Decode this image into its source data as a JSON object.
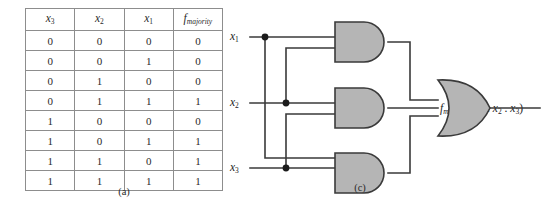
{
  "figure": {
    "parts": [
      {
        "id": "a",
        "caption": "(a)",
        "kind": "truth-table"
      },
      {
        "id": "c",
        "caption": "(c)",
        "kind": "logic-circuit"
      }
    ]
  },
  "truth_table": {
    "headers": [
      "x3",
      "x2",
      "x1",
      "fmajority"
    ],
    "header_display": [
      {
        "base": "x",
        "sub": "3",
        "sub_italic": false
      },
      {
        "base": "x",
        "sub": "2",
        "sub_italic": false
      },
      {
        "base": "x",
        "sub": "1",
        "sub_italic": false
      },
      {
        "base": "f",
        "sub": "majority",
        "sub_italic": true
      }
    ],
    "rows": [
      [
        "0",
        "0",
        "0",
        "0"
      ],
      [
        "0",
        "0",
        "1",
        "0"
      ],
      [
        "0",
        "1",
        "0",
        "0"
      ],
      [
        "0",
        "1",
        "1",
        "1"
      ],
      [
        "1",
        "0",
        "0",
        "0"
      ],
      [
        "1",
        "0",
        "1",
        "1"
      ],
      [
        "1",
        "1",
        "0",
        "1"
      ],
      [
        "1",
        "1",
        "1",
        "1"
      ]
    ]
  },
  "circuit": {
    "inputs": [
      {
        "name": "x1",
        "base": "x",
        "sub": "1"
      },
      {
        "name": "x2",
        "base": "x",
        "sub": "2"
      },
      {
        "name": "x3",
        "base": "x",
        "sub": "3"
      }
    ],
    "output": {
      "name": "fmajority",
      "base": "f",
      "sub": "majority",
      "args": " (x",
      "arg1_sub": "1",
      "sep1": " . x",
      "arg2_sub": "2",
      "sep2": " . x",
      "arg3_sub": "3",
      "close": ")"
    },
    "gates": [
      {
        "id": "and-gate-1",
        "type": "AND",
        "inputs": [
          "x1",
          "x2"
        ]
      },
      {
        "id": "and-gate-2",
        "type": "AND",
        "inputs": [
          "x2",
          "x3"
        ]
      },
      {
        "id": "and-gate-3",
        "type": "AND",
        "inputs": [
          "x1",
          "x3"
        ]
      },
      {
        "id": "or-gate-1",
        "type": "OR",
        "inputs": [
          "and-gate-1",
          "and-gate-2",
          "and-gate-3"
        ]
      }
    ],
    "junction_count": 3
  },
  "colors": {
    "gate_fill": "#b5b5b5",
    "gate_stroke": "#3a3a3a",
    "wire": "#3a3a3a",
    "table_border": "#8d8d8d",
    "text": "#1b1b1b",
    "background": "#ffffff"
  }
}
